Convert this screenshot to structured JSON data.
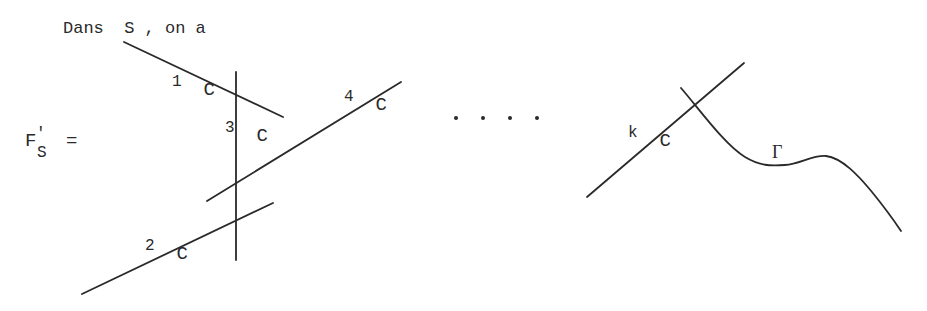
{
  "caption": "Dans  S , on a",
  "lhs": {
    "symbol": "F",
    "prime": "'",
    "subscript": "S",
    "equals": "="
  },
  "curves": [
    {
      "id": "C1",
      "base": "C",
      "sub": "1"
    },
    {
      "id": "C2",
      "base": "C",
      "sub": "2"
    },
    {
      "id": "C3",
      "base": "C",
      "sub": "3"
    },
    {
      "id": "C4",
      "base": "C",
      "sub": "4"
    },
    {
      "id": "Ck",
      "base": "C",
      "sub": "k"
    }
  ],
  "gamma": {
    "label": "Γ"
  },
  "ellipsis": "•  •  •  •",
  "colors": {
    "ink": "#2a2a2a",
    "background": "#ffffff"
  }
}
